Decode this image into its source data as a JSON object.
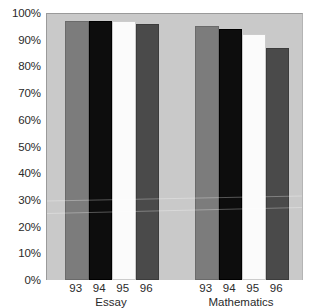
{
  "chart_data": {
    "type": "bar",
    "title": "",
    "subtitle": "",
    "xlabel": "",
    "ylabel": "",
    "ylim": [
      0,
      100
    ],
    "grid": false,
    "legend_position": "none",
    "y_ticks": [
      "0%",
      "10%",
      "20%",
      "30%",
      "40%",
      "50%",
      "60%",
      "70%",
      "80%",
      "90%",
      "100%"
    ],
    "y_tick_values": [
      0,
      10,
      20,
      30,
      40,
      50,
      60,
      70,
      80,
      90,
      100
    ],
    "groups": [
      "Essay",
      "Mathematics"
    ],
    "categories": [
      "93",
      "94",
      "95",
      "96"
    ],
    "series": [
      {
        "name": "Essay",
        "values": [
          97,
          97,
          97,
          96
        ]
      },
      {
        "name": "Mathematics",
        "values": [
          95,
          94,
          92,
          87
        ]
      }
    ],
    "bars": [
      {
        "group": "Essay",
        "category": "93",
        "value": 97,
        "shade": "shade-medgray"
      },
      {
        "group": "Essay",
        "category": "94",
        "value": 97,
        "shade": "shade-black"
      },
      {
        "group": "Essay",
        "category": "95",
        "value": 97,
        "shade": "shade-white"
      },
      {
        "group": "Essay",
        "category": "96",
        "value": 96,
        "shade": "shade-darkgray"
      },
      {
        "group": "Mathematics",
        "category": "93",
        "value": 95,
        "shade": "shade-medgray"
      },
      {
        "group": "Mathematics",
        "category": "94",
        "value": 94,
        "shade": "shade-black"
      },
      {
        "group": "Mathematics",
        "category": "95",
        "value": 92,
        "shade": "shade-white"
      },
      {
        "group": "Mathematics",
        "category": "96",
        "value": 87,
        "shade": "shade-darkgray"
      }
    ],
    "colors": {
      "plot_background": "#c9c9c9",
      "page_background": "#ffffff",
      "bar_medgray": "#7c7c7c",
      "bar_black": "#0d0d0d",
      "bar_white": "#fbfbfb",
      "bar_darkgray": "#4a4a4a",
      "text": "#2a2a2a",
      "axis_line": "#9a9a9a"
    }
  }
}
